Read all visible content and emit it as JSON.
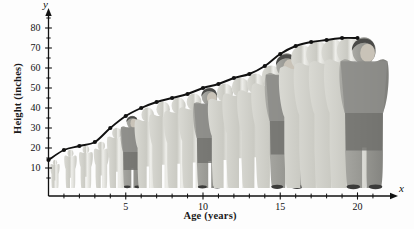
{
  "figure": {
    "kind": "textbook-growth-figure",
    "background_color": "#fdfdfd",
    "ink_color": "#111111",
    "silhouette_color": "#cfcfc9",
    "highlight_figure_color": "#8f8f8f"
  },
  "axes": {
    "y_variable": "y",
    "x_variable": "x",
    "y_title": "Height (inches)",
    "x_title": "Age (years)",
    "y_ticks": [
      10,
      20,
      30,
      40,
      50,
      60,
      70,
      80
    ],
    "x_ticks": [
      5,
      10,
      15,
      20
    ],
    "x_minor_ticks": [
      1,
      2,
      3,
      4,
      6,
      7,
      8,
      9,
      11,
      12,
      13,
      14,
      16,
      17,
      18,
      19,
      21
    ],
    "y_minor_ticks": [
      5,
      15,
      25,
      35,
      45,
      55,
      65,
      75,
      85
    ]
  },
  "chart_data": {
    "type": "line",
    "title": "",
    "xlabel": "Age (years)",
    "ylabel": "Height (inches)",
    "xlim": [
      0,
      21.5
    ],
    "ylim": [
      0,
      88
    ],
    "grid": false,
    "legend": "none",
    "marker": "filled-circle",
    "x": [
      0,
      1,
      2,
      3,
      4,
      5,
      6,
      7,
      8,
      9,
      10,
      11,
      12,
      13,
      14,
      15,
      16,
      17,
      18,
      19,
      20
    ],
    "y": [
      14,
      19,
      21,
      23,
      30,
      36,
      40,
      43,
      45,
      47,
      50,
      52,
      55,
      57,
      61,
      67,
      71,
      73,
      74,
      75,
      75
    ],
    "annotation": "Human growth curve illustrated with silhouettes of a person at each age"
  },
  "people": [
    {
      "age": 0,
      "height": 14,
      "style": "silhouette"
    },
    {
      "age": 1,
      "height": 19,
      "style": "silhouette"
    },
    {
      "age": 2,
      "height": 21,
      "style": "silhouette"
    },
    {
      "age": 3,
      "height": 23,
      "style": "silhouette"
    },
    {
      "age": 4,
      "height": 30,
      "style": "silhouette"
    },
    {
      "age": 5,
      "height": 36,
      "style": "detailed"
    },
    {
      "age": 6,
      "height": 40,
      "style": "silhouette"
    },
    {
      "age": 7,
      "height": 43,
      "style": "silhouette"
    },
    {
      "age": 8,
      "height": 45,
      "style": "silhouette"
    },
    {
      "age": 9,
      "height": 47,
      "style": "silhouette"
    },
    {
      "age": 10,
      "height": 50,
      "style": "detailed"
    },
    {
      "age": 11,
      "height": 52,
      "style": "silhouette"
    },
    {
      "age": 12,
      "height": 55,
      "style": "silhouette"
    },
    {
      "age": 13,
      "height": 57,
      "style": "silhouette"
    },
    {
      "age": 14,
      "height": 61,
      "style": "silhouette"
    },
    {
      "age": 15,
      "height": 67,
      "style": "detailed"
    },
    {
      "age": 16,
      "height": 71,
      "style": "silhouette"
    },
    {
      "age": 17,
      "height": 73,
      "style": "silhouette"
    },
    {
      "age": 18,
      "height": 74,
      "style": "silhouette"
    },
    {
      "age": 19,
      "height": 75,
      "style": "silhouette"
    },
    {
      "age": 20,
      "height": 75,
      "style": "detailed"
    }
  ]
}
